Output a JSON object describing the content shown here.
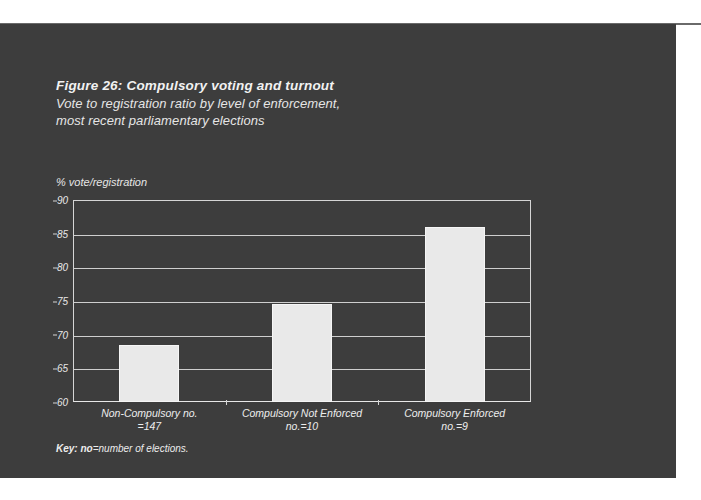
{
  "figure": {
    "title": "Figure 26: Compulsory voting and turnout",
    "subtitle_line1": "Vote to registration ratio by level of enforcement,",
    "subtitle_line2": "most recent parliamentary elections",
    "footnote_key_label": "Key:",
    "footnote_bold_term": "no",
    "footnote_text": "=number of elections.",
    "panel_color": "#3d3d3d",
    "bar_color": "#e9e9e9",
    "text_color": "#ececec"
  },
  "chart_data": {
    "type": "bar",
    "title": "Figure 26: Compulsory voting and turnout",
    "subtitle": "Vote to registration ratio by level of enforcement, most recent parliamentary elections",
    "xlabel": "",
    "ylabel": "% vote/registration",
    "ylim": [
      60,
      90
    ],
    "yticks": [
      60,
      65,
      70,
      75,
      80,
      85,
      90
    ],
    "grid": true,
    "legend": "none",
    "categories": [
      "Non-Compulsory no.=147",
      "Compulsory Not Enforced no.=10",
      "Compulsory Enforced no.=9"
    ],
    "category_lines": [
      [
        "Non-Compulsory no.",
        "=147"
      ],
      [
        "Compulsory Not Enforced",
        "no.=10"
      ],
      [
        "Compulsory Enforced",
        "no.=9"
      ]
    ],
    "values": [
      68.4,
      74.5,
      86.0
    ],
    "counts": [
      147,
      10,
      9
    ]
  }
}
